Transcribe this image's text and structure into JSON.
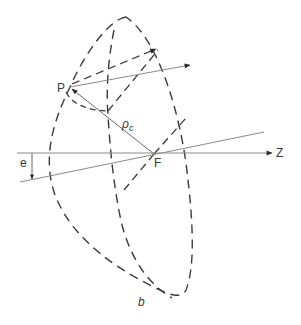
{
  "figure": {
    "panel_label": "b",
    "labels": {
      "point_p": "P",
      "focus": "F",
      "axis": "Z",
      "rho": "ρ",
      "rho_sub": "c",
      "offset": "e"
    },
    "colors": {
      "ink": "#3a3a3a",
      "thin_line": "#8a8a8a",
      "background": "#ffffff"
    }
  }
}
